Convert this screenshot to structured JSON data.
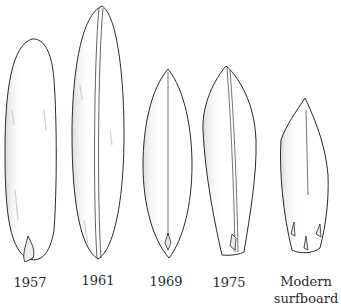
{
  "diagram": {
    "boards": [
      {
        "label": "1957",
        "line2": ""
      },
      {
        "label": "1961",
        "line2": ""
      },
      {
        "label": "1969",
        "line2": ""
      },
      {
        "label": "1975",
        "line2": ""
      },
      {
        "label": "Modern",
        "line2": "surfboard"
      }
    ],
    "colors": {
      "outline": "#2a2a2a",
      "shading": "#c8c8c8",
      "text": "#2b2b2b",
      "background": "#ffffff"
    }
  }
}
